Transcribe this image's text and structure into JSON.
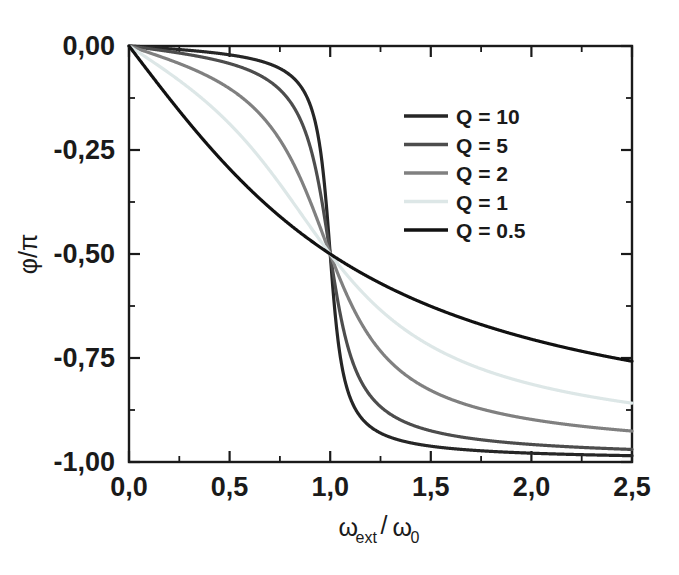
{
  "chart_data": {
    "type": "line",
    "title": "",
    "xlabel": "ωext/ω0",
    "xlabel_parts": {
      "base1": "ω",
      "sub1": "ext",
      "slash": "/",
      "base2": "ω",
      "sub2": "0"
    },
    "ylabel": "φ/π",
    "xlim": [
      0.0,
      2.5
    ],
    "ylim": [
      -1.0,
      0.0
    ],
    "grid": false,
    "legend_position": "upper right",
    "x_ticks": [
      {
        "value": 0.0,
        "label": "0,0"
      },
      {
        "value": 0.5,
        "label": "0,5"
      },
      {
        "value": 1.0,
        "label": "1,0"
      },
      {
        "value": 1.5,
        "label": "1,5"
      },
      {
        "value": 2.0,
        "label": "2,0"
      },
      {
        "value": 2.5,
        "label": "2,5"
      }
    ],
    "x_minor_ticks": [
      0.25,
      0.75,
      1.25,
      1.75,
      2.25
    ],
    "y_ticks": [
      {
        "value": 0.0,
        "label": "0,00"
      },
      {
        "value": -0.25,
        "label": "-0,25"
      },
      {
        "value": -0.5,
        "label": "-0,50"
      },
      {
        "value": -0.75,
        "label": "-0,75"
      },
      {
        "value": -1.0,
        "label": "-1,00"
      }
    ],
    "y_minor_ticks": [
      -0.125,
      -0.375,
      -0.625,
      -0.875
    ],
    "series": [
      {
        "name": "Q = 10",
        "Q": 10,
        "color": "#262626",
        "width": 3.2,
        "x": [
          0.0,
          0.05,
          0.1,
          0.15,
          0.2,
          0.25,
          0.3,
          0.35,
          0.4,
          0.45,
          0.5,
          0.55,
          0.6,
          0.65,
          0.7,
          0.75,
          0.8,
          0.85,
          0.9,
          0.92,
          0.94,
          0.96,
          0.98,
          1.0,
          1.02,
          1.04,
          1.06,
          1.08,
          1.1,
          1.15,
          1.2,
          1.25,
          1.3,
          1.4,
          1.5,
          1.6,
          1.7,
          1.8,
          1.9,
          2.0,
          2.1,
          2.2,
          2.3,
          2.4,
          2.5
        ],
        "y": [
          0.0,
          -0.00159,
          -0.00321,
          -0.00487,
          -0.00663,
          -0.00851,
          -0.01057,
          -0.01286,
          -0.01546,
          -0.01849,
          -0.0221,
          -0.02653,
          -0.03216,
          -0.03965,
          -0.0503,
          -0.06697,
          -0.09678,
          -0.16177,
          -0.33333,
          -0.40287,
          -0.46094,
          -0.4935,
          -0.4995,
          -0.5,
          -0.5005,
          -0.5132,
          -0.5745,
          -0.7012,
          -0.7945,
          -0.897,
          -0.9343,
          -0.9522,
          -0.9626,
          -0.974,
          -0.9797,
          -0.9831,
          -0.9853,
          -0.9869,
          -0.988,
          -0.9889,
          -0.9896,
          -0.9901,
          -0.9906,
          -0.991,
          -0.9913
        ]
      },
      {
        "name": "Q = 5",
        "Q": 5,
        "color": "#4d4d4d",
        "width": 3.2,
        "x": [
          0.0,
          0.05,
          0.1,
          0.15,
          0.2,
          0.25,
          0.3,
          0.35,
          0.4,
          0.45,
          0.5,
          0.55,
          0.6,
          0.65,
          0.7,
          0.75,
          0.8,
          0.85,
          0.9,
          0.95,
          1.0,
          1.05,
          1.1,
          1.15,
          1.2,
          1.3,
          1.4,
          1.5,
          1.6,
          1.7,
          1.8,
          1.9,
          2.0,
          2.1,
          2.2,
          2.3,
          2.4,
          2.5
        ],
        "y": [
          0.0,
          -0.00319,
          -0.00643,
          -0.00974,
          -0.01327,
          -0.01704,
          -0.02117,
          -0.02578,
          -0.03104,
          -0.03718,
          -0.04454,
          -0.05362,
          -0.06525,
          -0.08086,
          -0.10332,
          -0.13916,
          -0.20483,
          -0.3228,
          -0.439,
          -0.478,
          -0.5,
          -0.589,
          -0.726,
          -0.813,
          -0.862,
          -0.91,
          -0.932,
          -0.944,
          -0.952,
          -0.957,
          -0.961,
          -0.964,
          -0.966,
          -0.967,
          -0.9685,
          -0.9695,
          -0.9705,
          -0.9715
        ]
      },
      {
        "name": "Q = 2",
        "Q": 2,
        "color": "#808080",
        "width": 3.2,
        "x": [
          0.0,
          0.05,
          0.1,
          0.15,
          0.2,
          0.25,
          0.3,
          0.35,
          0.4,
          0.45,
          0.5,
          0.55,
          0.6,
          0.65,
          0.7,
          0.75,
          0.8,
          0.85,
          0.9,
          0.95,
          1.0,
          1.05,
          1.1,
          1.15,
          1.2,
          1.3,
          1.4,
          1.5,
          1.6,
          1.7,
          1.8,
          1.9,
          2.0,
          2.1,
          2.2,
          2.3,
          2.4,
          2.5
        ],
        "y": [
          0.0,
          -0.00797,
          -0.01608,
          -0.02436,
          -0.03322,
          -0.04272,
          -0.05317,
          -0.06497,
          -0.07855,
          -0.09453,
          -0.11382,
          -0.1378,
          -0.16859,
          -0.20958,
          -0.2664,
          -0.348,
          -0.44,
          -0.468,
          -0.484,
          -0.494,
          -0.5,
          -0.566,
          -0.638,
          -0.702,
          -0.753,
          -0.823,
          -0.864,
          -0.889,
          -0.906,
          -0.918,
          -0.926,
          -0.932,
          -0.937,
          -0.941,
          -0.944,
          -0.947,
          -0.949,
          -0.951
        ]
      },
      {
        "name": "Q = 1",
        "Q": 1,
        "color": "#dde7e7",
        "width": 3.2,
        "x": [
          0.0,
          0.05,
          0.1,
          0.15,
          0.2,
          0.25,
          0.3,
          0.35,
          0.4,
          0.45,
          0.5,
          0.55,
          0.6,
          0.65,
          0.7,
          0.75,
          0.8,
          0.85,
          0.9,
          0.95,
          1.0,
          1.05,
          1.1,
          1.15,
          1.2,
          1.3,
          1.4,
          1.5,
          1.6,
          1.7,
          1.8,
          1.9,
          2.0,
          2.1,
          2.2,
          2.3,
          2.4,
          2.5
        ],
        "y": [
          0.0,
          -0.01594,
          -0.03221,
          -0.04884,
          -0.06685,
          -0.08643,
          -0.10833,
          -0.1334,
          -0.163,
          -0.1988,
          -0.2429,
          -0.2977,
          -0.3645,
          -0.441,
          -0.491,
          -0.496,
          -0.498,
          -0.499,
          -0.4995,
          -0.4998,
          -0.5,
          -0.62,
          -0.72,
          -0.784,
          -0.825,
          -0.875,
          -0.9,
          -0.915,
          -0.926,
          -0.934,
          -0.94,
          -0.945,
          -0.949,
          -0.952,
          -0.955,
          -0.957,
          -0.959,
          -0.961
        ]
      },
      {
        "name": "Q = 0.5",
        "Q": 0.5,
        "color": "#111111",
        "width": 3.2,
        "x": [
          0.0,
          0.05,
          0.1,
          0.15,
          0.2,
          0.25,
          0.3,
          0.35,
          0.4,
          0.45,
          0.5,
          0.55,
          0.6,
          0.65,
          0.7,
          0.75,
          0.8,
          0.85,
          0.9,
          0.95,
          1.0,
          1.05,
          1.1,
          1.15,
          1.2,
          1.3,
          1.4,
          1.5,
          1.6,
          1.7,
          1.8,
          1.9,
          2.0,
          2.1,
          2.2,
          2.3,
          2.4,
          2.5
        ],
        "y": [
          0.0,
          -0.0318,
          -0.0642,
          -0.0974,
          -0.1318,
          -0.1676,
          -0.2049,
          -0.2437,
          -0.2839,
          -0.3253,
          -0.3675,
          -0.4098,
          -0.4516,
          -0.492,
          -0.531,
          -0.567,
          -0.601,
          -0.632,
          -0.661,
          -0.685,
          -0.5,
          -0.729,
          -0.747,
          -0.763,
          -0.777,
          -0.8,
          -0.818,
          -0.832,
          -0.843,
          -0.853,
          -0.86,
          -0.867,
          -0.873,
          -0.878,
          -0.882,
          -0.886,
          -0.889,
          -0.892
        ]
      }
    ],
    "legend_entries": [
      {
        "label": "Q = 10",
        "color": "#262626"
      },
      {
        "label": "Q = 5",
        "color": "#4d4d4d"
      },
      {
        "label": "Q = 2",
        "color": "#808080"
      },
      {
        "label": "Q = 1",
        "color": "#dde7e7"
      },
      {
        "label": "Q = 0.5",
        "color": "#111111"
      }
    ]
  }
}
